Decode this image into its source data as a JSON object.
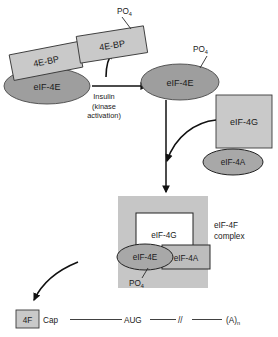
{
  "figure": {
    "colors": {
      "box_fill_gray": "#c9c9c9",
      "panel_fill_gray": "#c6c6c6",
      "ellipse_fill_gray": "#9e9e9e",
      "box_fill_white": "#ffffff",
      "stroke_dark": "#2b2b2b",
      "text": "#1a1a1a"
    }
  },
  "inactive_state": {
    "binding_protein_label": "4E-BP",
    "factor_label": "eIF-4E"
  },
  "signal": {
    "line1": "Insulin",
    "line2": "(kinase",
    "line3": "activation)"
  },
  "released_bp": {
    "label": "4E-BP",
    "phosphate": "PO",
    "phosphate_sub": "4"
  },
  "active_factor": {
    "label": "eIF-4E",
    "phosphate": "PO",
    "phosphate_sub": "4"
  },
  "free_subunits": {
    "eif4g_label": "eIF-4G",
    "eif4a_label": "eIF-4A"
  },
  "complex": {
    "eif4g_label": "eIF-4G",
    "eif4e_label": "eIF-4E",
    "eif4a_label": "eIF-4A",
    "phosphate": "PO",
    "phosphate_sub": "4",
    "name_line1": "eIF-4F",
    "name_line2": "complex"
  },
  "mrna": {
    "factor_box_label": "4F",
    "cap_label": "Cap",
    "start_codon": "AUG",
    "break_symbol": "//",
    "poly_a": "(A)",
    "poly_a_sub": "n"
  }
}
